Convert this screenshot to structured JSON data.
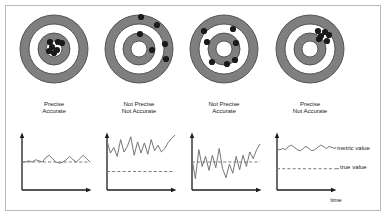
{
  "figure": {
    "title": "",
    "border_color": "#b9b9b9",
    "background": "#ffffff"
  },
  "colors": {
    "ring": "#7f7f7f",
    "ring_stroke": "#4a4a4a",
    "white": "#ffffff",
    "dot": "#1a1a1a",
    "axis": "#1c1c1c",
    "line": "#6e6e6e",
    "dashed": "#7a7a7a",
    "text": "#1c1c1c"
  },
  "targets": [
    {
      "id": "target-1",
      "label": "Precise\nAccurate",
      "label_line1": "Precise",
      "label_line2": "Accurate",
      "cx": 54,
      "cy": 49,
      "radii": [
        34,
        25,
        16,
        8
      ],
      "dots": [
        {
          "x": 50,
          "y": 42
        },
        {
          "x": 58,
          "y": 42
        },
        {
          "x": 62,
          "y": 43
        },
        {
          "x": 49,
          "y": 51
        },
        {
          "x": 54,
          "y": 53
        },
        {
          "x": 57,
          "y": 50
        },
        {
          "x": 52,
          "y": 47
        }
      ]
    },
    {
      "id": "target-2",
      "label": "Not Precise\nNot Accurate",
      "label_line1": "Not Precise",
      "label_line2": "Not Accurate",
      "cx": 139,
      "cy": 49,
      "radii": [
        34,
        25,
        16,
        8
      ],
      "dots": [
        {
          "x": 141,
          "y": 17
        },
        {
          "x": 157,
          "y": 25
        },
        {
          "x": 140,
          "y": 34
        },
        {
          "x": 165,
          "y": 44
        },
        {
          "x": 152,
          "y": 50
        },
        {
          "x": 166,
          "y": 59
        }
      ]
    },
    {
      "id": "target-3",
      "label": "Not Precise\nAccurate",
      "label_line1": "Not Precise",
      "label_line2": "Accurate",
      "cx": 224,
      "cy": 49,
      "radii": [
        34,
        25,
        16,
        8
      ],
      "dots": [
        {
          "x": 207,
          "y": 42
        },
        {
          "x": 233,
          "y": 29
        },
        {
          "x": 204,
          "y": 31
        },
        {
          "x": 236,
          "y": 43
        },
        {
          "x": 235,
          "y": 60
        },
        {
          "x": 212,
          "y": 62
        },
        {
          "x": 227,
          "y": 64
        }
      ]
    },
    {
      "id": "target-4",
      "label": "Precise\nNot Accurate",
      "label_line1": "Precise",
      "label_line2": "Not Accurate",
      "cx": 310,
      "cy": 49,
      "radii": [
        34,
        25,
        16,
        8
      ],
      "dots": [
        {
          "x": 318,
          "y": 31
        },
        {
          "x": 325,
          "y": 32
        },
        {
          "x": 321,
          "y": 36
        },
        {
          "x": 329,
          "y": 35
        },
        {
          "x": 319,
          "y": 39
        },
        {
          "x": 327,
          "y": 41
        }
      ]
    }
  ],
  "legend": {
    "metric_value": "metric value",
    "true_value": "true value",
    "time": "time"
  },
  "chart_data": [
    {
      "id": "chart-1",
      "type": "line",
      "title": "Precise Accurate",
      "xlabel": "",
      "ylabel": "",
      "true_value": 0.5,
      "ylim": [
        0,
        1
      ],
      "xlim": [
        0,
        20
      ],
      "legend": [],
      "grid": false,
      "series": [
        {
          "name": "metric value",
          "x": [
            0,
            1,
            2,
            3,
            4,
            5,
            6,
            7,
            8,
            9,
            10,
            11,
            12,
            13,
            14,
            15,
            16,
            17,
            18,
            19,
            20
          ],
          "values": [
            0.5,
            0.5,
            0.52,
            0.5,
            0.54,
            0.52,
            0.5,
            0.58,
            0.62,
            0.56,
            0.5,
            0.48,
            0.5,
            0.54,
            0.6,
            0.54,
            0.5,
            0.56,
            0.62,
            0.56,
            0.5
          ]
        }
      ]
    },
    {
      "id": "chart-2",
      "type": "line",
      "title": "Not Precise Not Accurate",
      "xlabel": "",
      "ylabel": "",
      "true_value": 0.33,
      "ylim": [
        0,
        1
      ],
      "xlim": [
        0,
        20
      ],
      "legend": [],
      "grid": false,
      "series": [
        {
          "name": "metric value",
          "x": [
            0,
            1,
            2,
            3,
            4,
            5,
            6,
            7,
            8,
            9,
            10,
            11,
            12,
            13,
            14,
            15,
            16,
            17,
            18,
            19,
            20
          ],
          "values": [
            0.88,
            0.66,
            0.76,
            0.6,
            0.9,
            0.68,
            0.78,
            0.95,
            0.62,
            0.86,
            0.66,
            0.84,
            0.64,
            0.9,
            0.7,
            0.8,
            0.68,
            0.74,
            0.85,
            0.92,
            0.98
          ]
        }
      ]
    },
    {
      "id": "chart-3",
      "type": "line",
      "title": "Not Precise Accurate",
      "xlabel": "",
      "ylabel": "",
      "true_value": 0.5,
      "ylim": [
        0,
        1
      ],
      "xlim": [
        0,
        20
      ],
      "legend": [],
      "grid": false,
      "series": [
        {
          "name": "metric value",
          "x": [
            0,
            1,
            2,
            3,
            4,
            5,
            6,
            7,
            8,
            9,
            10,
            11,
            12,
            13,
            14,
            15,
            16,
            17,
            18,
            19,
            20
          ],
          "values": [
            0.55,
            0.2,
            0.72,
            0.42,
            0.6,
            0.35,
            0.62,
            0.4,
            0.74,
            0.38,
            0.22,
            0.46,
            0.3,
            0.6,
            0.36,
            0.62,
            0.42,
            0.68,
            0.56,
            0.72,
            0.82
          ]
        }
      ]
    },
    {
      "id": "chart-4",
      "type": "line",
      "title": "Precise Not Accurate",
      "xlabel": "time",
      "ylabel": "",
      "true_value": 0.38,
      "ylim": [
        0,
        1
      ],
      "xlim": [
        0,
        20
      ],
      "legend": [
        "metric value",
        "true value"
      ],
      "grid": false,
      "series": [
        {
          "name": "metric value",
          "x": [
            0,
            1,
            2,
            3,
            4,
            5,
            6,
            7,
            8,
            9,
            10,
            11,
            12,
            13,
            14,
            15,
            16,
            17,
            18,
            19,
            20
          ],
          "values": [
            0.72,
            0.72,
            0.74,
            0.72,
            0.78,
            0.8,
            0.76,
            0.72,
            0.7,
            0.74,
            0.78,
            0.74,
            0.7,
            0.72,
            0.76,
            0.8,
            0.78,
            0.74,
            0.78,
            0.76,
            0.74
          ]
        }
      ]
    }
  ]
}
